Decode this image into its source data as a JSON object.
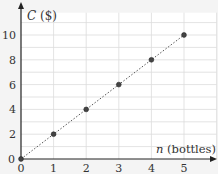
{
  "chart_data": {
    "type": "scatter",
    "title": "",
    "xlabel": "n (bottles)",
    "ylabel": "C ($)",
    "xlabel_var": "n",
    "xlabel_unit": "(bottles)",
    "ylabel_var": "C",
    "ylabel_unit": "($)",
    "x_ticks": [
      "0",
      "1",
      "2",
      "3",
      "4",
      "5"
    ],
    "y_ticks": [
      "0",
      "2",
      "4",
      "6",
      "8",
      "10"
    ],
    "xlim": [
      0,
      6
    ],
    "ylim": [
      0,
      11.8
    ],
    "grid": true,
    "series": [
      {
        "name": "cost",
        "points": [
          [
            0,
            0
          ],
          [
            1,
            2
          ],
          [
            2,
            4
          ],
          [
            3,
            6
          ],
          [
            4,
            8
          ],
          [
            5,
            10
          ]
        ],
        "line": "dotted",
        "color": "#555555"
      }
    ]
  },
  "colors": {
    "background": "#f4f4f4",
    "plot_bg": "#ffffff",
    "grid": "#dcdcdc",
    "axis": "#222222",
    "point": "#444444"
  }
}
